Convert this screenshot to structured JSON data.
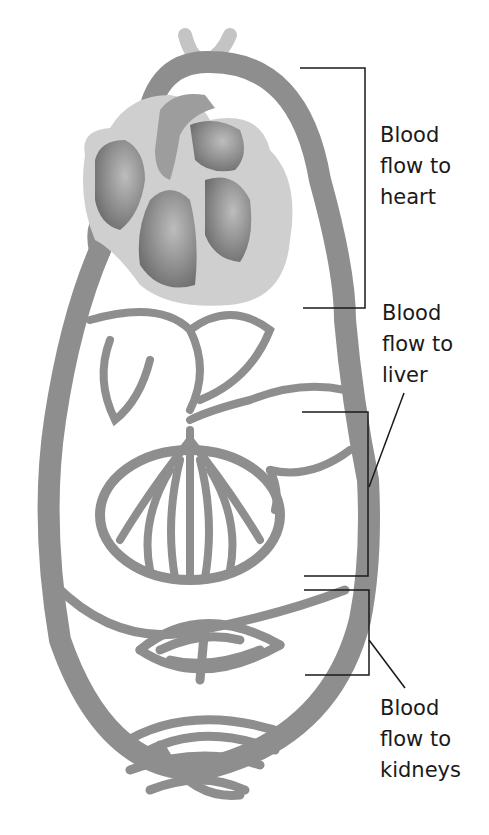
{
  "diagram": {
    "title": "",
    "labels": {
      "heart": {
        "lines": [
          "Blood",
          "flow to",
          "heart"
        ]
      },
      "liver": {
        "lines": [
          "Blood",
          "flow to",
          "liver"
        ]
      },
      "kidneys": {
        "lines": [
          "Blood",
          "flow to",
          "kidneys"
        ]
      }
    },
    "colors": {
      "vessel": "#8e8e8e",
      "heart_outer": "#cfcfcf",
      "heart_chamber": "#7a7a7a",
      "bracket": "#1a1a1a",
      "text": "#1a1a1a"
    }
  }
}
